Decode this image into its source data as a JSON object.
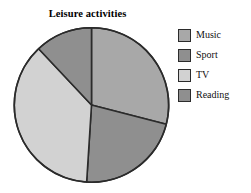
{
  "chart_data": {
    "type": "pie",
    "title": "Leisure activities",
    "xlabel": "",
    "ylabel": "",
    "legend_position": "right",
    "grid": false,
    "categories": [
      "Music",
      "Sport",
      "TV",
      "Reading"
    ],
    "values": [
      29,
      22,
      37,
      12
    ],
    "unit": "percent",
    "start_angle_deg": 0,
    "direction": "clockwise",
    "slices": [
      {
        "label": "Music",
        "value": 29,
        "color": "#a8a8a8",
        "start_deg": 0,
        "end_deg": 104.4
      },
      {
        "label": "Sport",
        "value": 22,
        "color": "#8f8f8f",
        "start_deg": 104.4,
        "end_deg": 183.6
      },
      {
        "label": "TV",
        "value": 37,
        "color": "#d2d2d2",
        "start_deg": 183.6,
        "end_deg": 316.8
      },
      {
        "label": "Reading",
        "value": 12,
        "color": "#8f8f8f",
        "start_deg": 316.8,
        "end_deg": 360
      }
    ],
    "colors": {
      "music": "#a8a8a8",
      "sport": "#8f8f8f",
      "tv": "#d2d2d2",
      "reading": "#8f8f8f",
      "outline": "#2b2b2b",
      "background": "#ffffff",
      "text": "#111111"
    }
  },
  "title": {
    "text": "Leisure activities"
  },
  "legend": {
    "items": [
      {
        "label": "Music",
        "color": "#a8a8a8"
      },
      {
        "label": "Sport",
        "color": "#8f8f8f"
      },
      {
        "label": "TV",
        "color": "#d2d2d2"
      },
      {
        "label": "Reading",
        "color": "#8f8f8f"
      }
    ]
  }
}
